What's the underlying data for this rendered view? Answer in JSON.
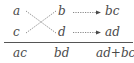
{
  "diagram": {
    "type": "cross-multiplication",
    "left_column": [
      "a",
      "c"
    ],
    "middle_column": [
      "b",
      "d"
    ],
    "right_column": [
      "bc",
      "ad"
    ],
    "bottom_row": [
      "ac",
      "bd",
      "ad+bc"
    ],
    "colors": {
      "text": "#4a4a4a",
      "lines": "#6a6a6a"
    }
  }
}
